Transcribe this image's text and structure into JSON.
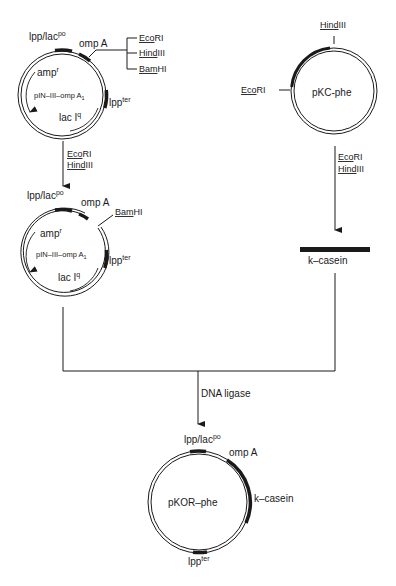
{
  "diagram": {
    "type": "plasmid construction flowchart",
    "plasmid_1": {
      "name": "pIN–III–omp A",
      "name_sub": "1",
      "labels": {
        "promoter": "lpp/lac",
        "promoter_sup": "po",
        "signal": "omp A",
        "terminator": "lpp",
        "terminator_sup": "ter",
        "resistance": "amp",
        "resistance_sup": "r",
        "repressor": "lac I",
        "repressor_sup": "q"
      },
      "sites": [
        {
          "under": "Eco",
          "rest": "RI"
        },
        {
          "under": "Hind",
          "rest": "III"
        },
        {
          "under": "Bam",
          "rest": "HI"
        }
      ]
    },
    "step_1": {
      "enzymes": [
        {
          "under": "Eco",
          "rest": "RI"
        },
        {
          "under": "Hind",
          "rest": "III"
        }
      ]
    },
    "plasmid_1_cut": {
      "name": "pIN–III–omp A",
      "name_sub": "1",
      "site": {
        "under": "Bam",
        "rest": "HI"
      }
    },
    "plasmid_2": {
      "name": "pKC-phe",
      "site_top": {
        "under": "Hind",
        "rest": "III"
      },
      "site_left": {
        "under": "Eco",
        "rest": "RI"
      }
    },
    "step_2": {
      "enzymes": [
        {
          "under": "Eco",
          "rest": "RI"
        },
        {
          "under": "Hind",
          "rest": "III"
        }
      ]
    },
    "fragment": {
      "name": "k–casein"
    },
    "ligation": {
      "label": "DNA ligase"
    },
    "product": {
      "name": "pKOR–phe",
      "labels": {
        "promoter": "lpp/lac",
        "promoter_sup": "po",
        "signal": "omp A",
        "insert": "k–casein",
        "terminator": "lpp",
        "terminator_sup": "ter"
      }
    }
  }
}
